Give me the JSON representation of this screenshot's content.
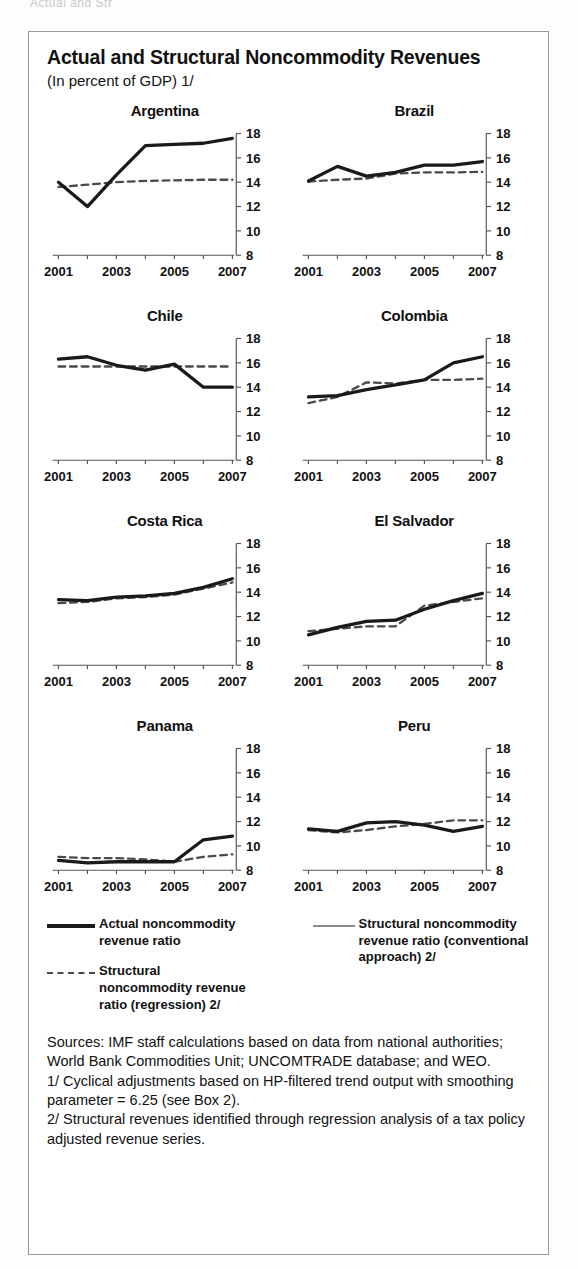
{
  "page": {
    "clipped_header_text": "Actual and Str"
  },
  "figure": {
    "title": "Actual and Structural Noncommodity Revenues",
    "subtitle": "(In percent of GDP) 1/"
  },
  "legend": {
    "left": [
      {
        "key": "solid",
        "label": "Actual noncommodity revenue ratio"
      },
      {
        "key": "dashed",
        "label": "Structural noncommodity revenue ratio (regression) 2/"
      }
    ],
    "right": [
      {
        "key": "thin",
        "label": "Structural noncommodity revenue ratio (conventional approach) 2/"
      }
    ]
  },
  "notes": {
    "sources": "Sources:  IMF staff calculations based on data from national authorities; World Bank Commodities Unit; UNCOMTRADE database; and WEO.",
    "note1": "1/ Cyclical adjustments based on HP-filtered trend output with smoothing parameter = 6.25 (see Box 2).",
    "note2": "2/ Structural revenues identified through regression analysis of a tax policy adjusted revenue series."
  },
  "colors": {
    "actual": "#1a1a1a",
    "structural_regression": "#4a4a4a",
    "structural_conventional": "#8c8c8c",
    "axis": "#555555",
    "border": "#9a9a9a"
  },
  "chart_data": {
    "type": "line",
    "title": "Actual and Structural Noncommodity Revenues",
    "subtitle": "(In percent of GDP) 1/",
    "xlabel": "",
    "ylabel": "",
    "x": [
      2001,
      2002,
      2003,
      2004,
      2005,
      2006,
      2007
    ],
    "xtick_labels": [
      "2001",
      "",
      "2003",
      "",
      "2005",
      "",
      "2007"
    ],
    "ylim": [
      8,
      18
    ],
    "yticks": [
      8,
      10,
      12,
      14,
      16,
      18
    ],
    "grid": false,
    "legend_position": "below",
    "panels": [
      {
        "title": "Argentina",
        "series": [
          {
            "name": "Actual noncommodity revenue ratio",
            "style": "solid",
            "values": [
              14.0,
              12.0,
              14.6,
              17.0,
              17.1,
              17.2,
              17.6
            ]
          },
          {
            "name": "Structural noncommodity revenue ratio (regression) 2/",
            "style": "dashed",
            "values": [
              13.6,
              13.8,
              14.0,
              14.1,
              14.15,
              14.2,
              14.2
            ]
          },
          {
            "name": "Structural noncommodity revenue ratio (conventional approach) 2/",
            "style": "thin",
            "values": [
              14.0,
              12.0,
              14.6,
              17.0,
              17.1,
              17.2,
              17.6
            ]
          }
        ]
      },
      {
        "title": "Brazil",
        "series": [
          {
            "name": "Actual noncommodity revenue ratio",
            "style": "solid",
            "values": [
              14.1,
              15.3,
              14.5,
              14.8,
              15.4,
              15.4,
              15.7
            ]
          },
          {
            "name": "Structural noncommodity revenue ratio (regression) 2/",
            "style": "dashed",
            "values": [
              14.05,
              14.2,
              14.3,
              14.7,
              14.8,
              14.8,
              14.85
            ]
          },
          {
            "name": "Structural noncommodity revenue ratio (conventional approach) 2/",
            "style": "thin",
            "values": [
              14.1,
              15.3,
              14.45,
              14.8,
              15.4,
              15.4,
              15.7
            ]
          }
        ]
      },
      {
        "title": "Chile",
        "series": [
          {
            "name": "Actual noncommodity revenue ratio",
            "style": "solid",
            "values": [
              16.3,
              16.5,
              15.8,
              15.4,
              15.9,
              14.0,
              14.0
            ]
          },
          {
            "name": "Structural noncommodity revenue ratio (regression) 2/",
            "style": "dashed",
            "values": [
              15.7,
              15.7,
              15.7,
              15.7,
              15.7,
              15.7,
              15.7
            ]
          },
          {
            "name": "Structural noncommodity revenue ratio (conventional approach) 2/",
            "style": "thin",
            "values": [
              16.3,
              16.5,
              15.8,
              15.4,
              15.9,
              14.0,
              14.0
            ]
          }
        ]
      },
      {
        "title": "Colombia",
        "series": [
          {
            "name": "Actual noncommodity revenue ratio",
            "style": "solid",
            "values": [
              13.2,
              13.3,
              13.8,
              14.2,
              14.6,
              16.0,
              16.5
            ]
          },
          {
            "name": "Structural noncommodity revenue ratio (regression) 2/",
            "style": "dashed",
            "values": [
              12.7,
              13.2,
              14.4,
              14.3,
              14.6,
              14.6,
              14.7
            ]
          },
          {
            "name": "Structural noncommodity revenue ratio (conventional approach) 2/",
            "style": "thin",
            "values": [
              13.2,
              13.3,
              13.8,
              14.2,
              14.6,
              16.0,
              16.5
            ]
          }
        ]
      },
      {
        "title": "Costa Rica",
        "series": [
          {
            "name": "Actual noncommodity revenue ratio",
            "style": "solid",
            "values": [
              13.4,
              13.3,
              13.6,
              13.7,
              13.9,
              14.4,
              15.1
            ]
          },
          {
            "name": "Structural noncommodity revenue ratio (regression) 2/",
            "style": "dashed",
            "values": [
              13.1,
              13.2,
              13.5,
              13.6,
              13.8,
              14.3,
              14.8
            ]
          },
          {
            "name": "Structural noncommodity revenue ratio (conventional approach) 2/",
            "style": "thin",
            "values": [
              13.4,
              13.3,
              13.6,
              13.7,
              13.9,
              14.4,
              15.1
            ]
          }
        ]
      },
      {
        "title": "El Salvador",
        "series": [
          {
            "name": "Actual noncommodity revenue ratio",
            "style": "solid",
            "values": [
              10.5,
              11.1,
              11.6,
              11.7,
              12.6,
              13.3,
              13.9
            ]
          },
          {
            "name": "Structural noncommodity revenue ratio (regression) 2/",
            "style": "dashed",
            "values": [
              10.8,
              11.0,
              11.2,
              11.2,
              12.9,
              13.2,
              13.5
            ]
          },
          {
            "name": "Structural noncommodity revenue ratio (conventional approach) 2/",
            "style": "thin",
            "values": [
              10.5,
              11.1,
              11.6,
              11.7,
              12.6,
              13.3,
              13.9
            ]
          }
        ]
      },
      {
        "title": "Panama",
        "series": [
          {
            "name": "Actual noncommodity revenue ratio",
            "style": "solid",
            "values": [
              8.8,
              8.6,
              8.7,
              8.7,
              8.7,
              10.5,
              10.8
            ]
          },
          {
            "name": "Structural noncommodity revenue ratio (regression) 2/",
            "style": "dashed",
            "values": [
              9.1,
              9.0,
              9.0,
              8.9,
              8.7,
              9.1,
              9.3
            ]
          },
          {
            "name": "Structural noncommodity revenue ratio (conventional approach) 2/",
            "style": "thin",
            "values": [
              8.8,
              8.6,
              8.7,
              8.7,
              8.7,
              10.5,
              10.8
            ]
          }
        ]
      },
      {
        "title": "Peru",
        "series": [
          {
            "name": "Actual noncommodity revenue ratio",
            "style": "solid",
            "values": [
              11.4,
              11.2,
              11.9,
              12.0,
              11.7,
              11.2,
              11.6
            ]
          },
          {
            "name": "Structural noncommodity revenue ratio (regression) 2/",
            "style": "dashed",
            "values": [
              11.3,
              11.1,
              11.3,
              11.6,
              11.8,
              12.1,
              12.1
            ]
          },
          {
            "name": "Structural noncommodity revenue ratio (conventional approach) 2/",
            "style": "thin",
            "values": [
              11.4,
              11.2,
              11.9,
              12.0,
              11.7,
              11.2,
              11.6
            ]
          }
        ]
      }
    ]
  }
}
